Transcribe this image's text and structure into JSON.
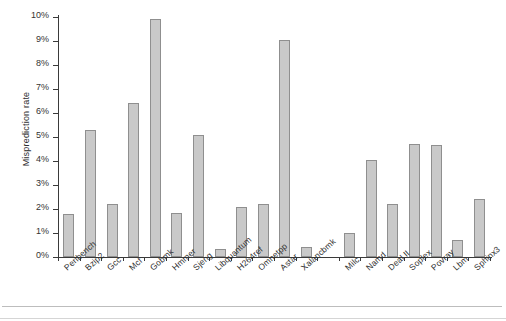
{
  "chart_data": {
    "type": "bar",
    "title": "",
    "xlabel": "",
    "ylabel": "Misprediction rate",
    "ylim": [
      0,
      10
    ],
    "ytick_labels": [
      "0%",
      "1%",
      "2%",
      "3%",
      "4%",
      "5%",
      "6%",
      "7%",
      "8%",
      "9%",
      "10%"
    ],
    "ytick_values": [
      0,
      1,
      2,
      3,
      4,
      5,
      6,
      7,
      8,
      9,
      10
    ],
    "grid": false,
    "legend": "none",
    "unit": "%",
    "categories": [
      "Perlbench",
      "Bzip2",
      "Gcc",
      "Mcf",
      "Gobmk",
      "Hmmer",
      "Sjeng",
      "Libquantum",
      "H264ref",
      "Omnetpp",
      "Astar",
      "Xalancbmk",
      "",
      "Milc",
      "Namd",
      "Deal II",
      "Soplex",
      "Povray",
      "Lbm",
      "Sphinx3"
    ],
    "values": [
      1.8,
      5.3,
      2.2,
      6.4,
      9.9,
      1.85,
      5.1,
      0.35,
      2.1,
      2.2,
      9.05,
      0.4,
      null,
      1.0,
      4.05,
      2.2,
      4.7,
      4.65,
      0.7,
      2.4
    ],
    "bar_color": "#c9c9c9",
    "bar_border_color": "#8f8f8f",
    "axis_color": "#3a3a3a"
  }
}
